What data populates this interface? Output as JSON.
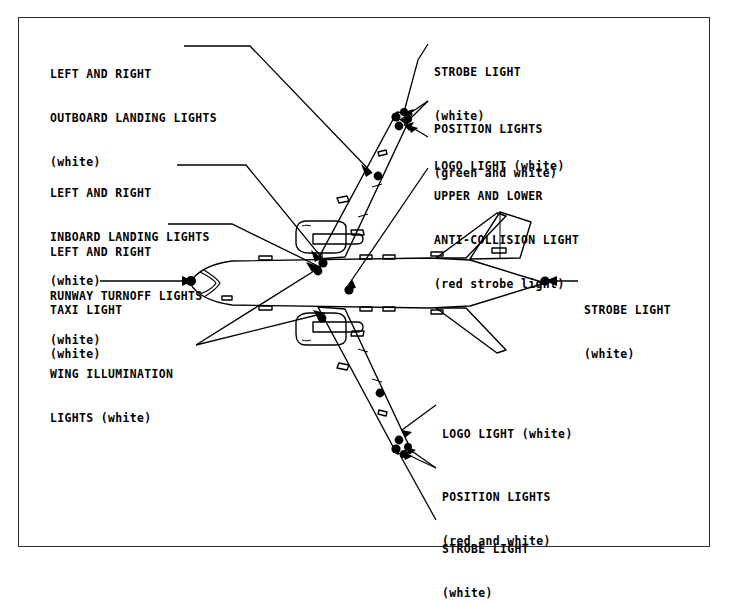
{
  "diagram": {
    "view": "top plan view of twin-engine jet airliner",
    "line_color": "#000000",
    "background_color": "#ffffff",
    "border_color": "#2a2a2a"
  },
  "labels": {
    "outboard_landing": {
      "line1": "LEFT AND RIGHT",
      "line2": "OUTBOARD LANDING LIGHTS",
      "line3": "(white)"
    },
    "inboard_landing": {
      "line1": "LEFT AND RIGHT",
      "line2": "INBOARD LANDING LIGHTS",
      "line3": "(white)"
    },
    "runway_turnoff": {
      "line1": "LEFT AND RIGHT",
      "line2": "RUNWAY TURNOFF LIGHTS",
      "line3": "(white)"
    },
    "taxi": {
      "line1": "TAXI LIGHT",
      "line2": "(white)"
    },
    "wing_illumination": {
      "line1": "WING ILLUMINATION",
      "line2": "LIGHTS (white)"
    },
    "strobe_top": {
      "line1": "STROBE LIGHT",
      "line2": "(white)"
    },
    "position_top": {
      "line1": "POSITION LIGHTS",
      "line2": "(green and white)"
    },
    "logo_top": {
      "line1": "LOGO LIGHT (white)"
    },
    "anti_collision": {
      "line1": "UPPER AND LOWER",
      "line2": "ANTI-COLLISION LIGHT",
      "line3": "(red strobe light)"
    },
    "strobe_tail": {
      "line1": "STROBE LIGHT",
      "line2": "(white)"
    },
    "logo_bottom": {
      "line1": "LOGO LIGHT (white)"
    },
    "position_bottom": {
      "line1": "POSITION LIGHTS",
      "line2": "(red and white)"
    },
    "strobe_bottom": {
      "line1": "STROBE LIGHT",
      "line2": "(white)"
    }
  },
  "light_colors": {
    "white": "white",
    "green_and_white": "green and white",
    "red_and_white": "red and white",
    "red_strobe": "red strobe light"
  }
}
